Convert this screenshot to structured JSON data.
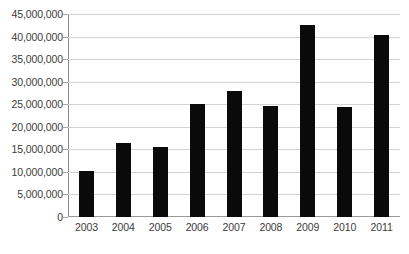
{
  "chart_data": {
    "type": "bar",
    "title": "",
    "subtitle": "",
    "xlabel": "",
    "ylabel": "",
    "categories": [
      "2003",
      "2004",
      "2005",
      "2006",
      "2007",
      "2008",
      "2009",
      "2010",
      "2011"
    ],
    "values": [
      10300000,
      16300000,
      15500000,
      25000000,
      28000000,
      24500000,
      42500000,
      24300000,
      40300000
    ],
    "series": [
      {
        "name": "",
        "values": [
          10300000,
          16300000,
          15500000,
          25000000,
          28000000,
          24500000,
          42500000,
          24300000,
          40300000
        ]
      }
    ],
    "ylim": [
      0,
      45000000
    ],
    "ytick_values": [
      0,
      5000000,
      10000000,
      15000000,
      20000000,
      25000000,
      30000000,
      35000000,
      40000000,
      45000000
    ],
    "ytick_labels": [
      "0",
      "5,000,000",
      "10,000,000",
      "15,000,000",
      "20,000,000",
      "25,000,000",
      "30,000,000",
      "35,000,000",
      "40,000,000",
      "45,000,000"
    ],
    "grid": true,
    "grid_axis": "y",
    "legend": false,
    "legend_position": "none",
    "bar_color": "#0a0a0a",
    "gridline_color": "#d2d2d2",
    "axis_color": "#8d8d8d",
    "background_color": "#ffffff",
    "text_color": "#3b3b3b"
  }
}
